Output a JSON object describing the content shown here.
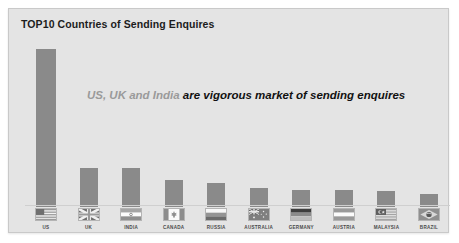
{
  "chart_title": "TOP10 Countries of Sending Enquires",
  "annotation": {
    "soft_text": "US, UK and India ",
    "strong_text": "are vigorous market of sending enquires"
  },
  "colors": {
    "panel_background": "#e4e4e4",
    "panel_border": "#c9c9c9",
    "bar_fill": "#8a8a8a",
    "baseline": "#cfcfcf",
    "title_text": "#1c1c1c",
    "annotation_soft": "#9a9a9a",
    "annotation_strong": "#111111",
    "label_text": "#4a4a4a"
  },
  "chart_data": {
    "type": "bar",
    "title": "TOP10 Countries of Sending Enquires",
    "xlabel": "",
    "ylabel": "",
    "ylim": [
      0,
      100
    ],
    "grid": false,
    "legend": "none",
    "categories": [
      "US",
      "UK",
      "INDIA",
      "CANADA",
      "RUSSIA",
      "AUSTRALIA",
      "GERMANY",
      "AUSTRIA",
      "MALAYSIA",
      "BRAZIL"
    ],
    "values": [
      100,
      25,
      25,
      17,
      15,
      12,
      11,
      11,
      10,
      8
    ],
    "annotations": [
      "US, UK and India are vigorous market of sending enquires"
    ]
  },
  "bars": [
    {
      "name": "US",
      "label": "US",
      "value": 100,
      "flag": "flag-us"
    },
    {
      "name": "UK",
      "label": "UK",
      "value": 25,
      "flag": "flag-uk"
    },
    {
      "name": "INDIA",
      "label": "INDIA",
      "value": 25,
      "flag": "flag-india"
    },
    {
      "name": "CANADA",
      "label": "CANADA",
      "value": 17,
      "flag": "flag-canada"
    },
    {
      "name": "RUSSIA",
      "label": "RUSSIA",
      "value": 15,
      "flag": "flag-russia"
    },
    {
      "name": "AUSTRALIA",
      "label": "AUSTRALIA",
      "value": 12,
      "flag": "flag-australia"
    },
    {
      "name": "GERMANY",
      "label": "GERMANY",
      "value": 11,
      "flag": "flag-germany"
    },
    {
      "name": "AUSTRIA",
      "label": "AUSTRIA",
      "value": 11,
      "flag": "flag-austria"
    },
    {
      "name": "MALAYSIA",
      "label": "MALAYSIA",
      "value": 10,
      "flag": "flag-malaysia"
    },
    {
      "name": "BRAZIL",
      "label": "BRAZIL",
      "value": 8,
      "flag": "flag-brazil"
    }
  ]
}
